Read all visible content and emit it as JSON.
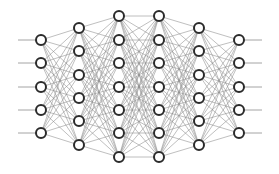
{
  "diagram": {
    "type": "neural-network",
    "background": "#ffffff",
    "edge_color": "#8a8a8a",
    "edge_width": 0.55,
    "io_line_color": "#9a9a9a",
    "node_stroke": "#2b2b2b",
    "node_fill": "#ffffff",
    "node_radius": 5,
    "node_stroke_width": 2,
    "input_line_start_x": 18,
    "output_line_end_x": 262,
    "layers": [
      {
        "name": "input-layer",
        "x": 41,
        "ys": [
          40,
          63,
          87,
          110,
          133
        ]
      },
      {
        "name": "hidden-layer-1",
        "x": 79,
        "ys": [
          28,
          51,
          75,
          98,
          121,
          145
        ]
      },
      {
        "name": "hidden-layer-2",
        "x": 119,
        "ys": [
          16,
          40,
          63,
          87,
          110,
          133,
          157
        ]
      },
      {
        "name": "hidden-layer-3",
        "x": 159,
        "ys": [
          16,
          40,
          63,
          87,
          110,
          133,
          157
        ]
      },
      {
        "name": "hidden-layer-4",
        "x": 199,
        "ys": [
          28,
          51,
          75,
          98,
          121,
          145
        ]
      },
      {
        "name": "output-layer",
        "x": 239,
        "ys": [
          40,
          63,
          87,
          110,
          133
        ]
      }
    ]
  }
}
